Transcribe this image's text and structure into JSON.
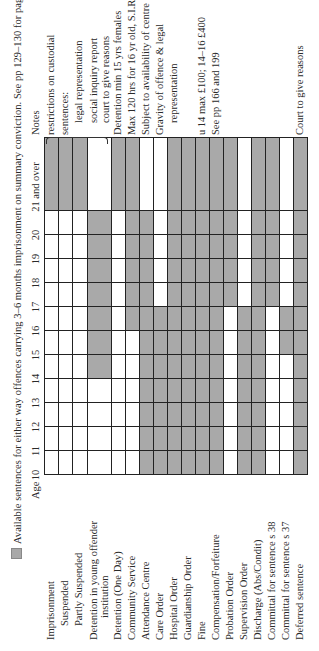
{
  "title": {
    "legend_label": "Available sentences for either way offences carrying 3–6 months imprisonment on summary conviction. See pp 129–130 for page references.",
    "legend_color": "#a9a9a9"
  },
  "header": {
    "age_word": "Age",
    "notes_word": "Notes",
    "ages": [
      "10",
      "11",
      "12",
      "13",
      "14",
      "15",
      "16",
      "17",
      "18",
      "19",
      "20",
      "21 and over"
    ]
  },
  "chart_data": {
    "type": "table",
    "title": "Available sentences for either way offences carrying 3–6 months imprisonment on summary conviction. See pp 129–130 for page references.",
    "columns": [
      "10",
      "11",
      "12",
      "13",
      "14",
      "15",
      "16",
      "17",
      "18",
      "19",
      "20",
      "21 and over"
    ],
    "legend": {
      "shaded": "Available sentence"
    },
    "rows": [
      {
        "label": "Imprisonment",
        "indent": false,
        "available": [
          0,
          0,
          0,
          0,
          0,
          0,
          0,
          0,
          0,
          0,
          0,
          1
        ]
      },
      {
        "label": "Suspended",
        "indent": true,
        "available": [
          0,
          0,
          0,
          0,
          0,
          0,
          0,
          0,
          0,
          0,
          0,
          1
        ]
      },
      {
        "label": "Partly Suspended",
        "indent": true,
        "available": [
          0,
          0,
          0,
          0,
          0,
          0,
          0,
          0,
          0,
          0,
          0,
          1
        ]
      },
      {
        "label": "Detention in young offender institution",
        "label_lines": [
          "Detention in young offender",
          "institution"
        ],
        "indent": false,
        "available": [
          0,
          0,
          0,
          0,
          1,
          1,
          1,
          1,
          1,
          1,
          1,
          0
        ]
      },
      {
        "label": "Detention (One Day)",
        "indent": false,
        "available": [
          0,
          0,
          0,
          0,
          0,
          0,
          0,
          0,
          0,
          0,
          0,
          1
        ]
      },
      {
        "label": "Community Service",
        "indent": false,
        "available": [
          0,
          0,
          0,
          0,
          0,
          0,
          1,
          1,
          1,
          1,
          1,
          1
        ]
      },
      {
        "label": "Attendance Centre",
        "indent": false,
        "available": [
          1,
          1,
          1,
          1,
          1,
          1,
          1,
          1,
          1,
          1,
          1,
          0
        ]
      },
      {
        "label": "Care Order",
        "indent": false,
        "available": [
          1,
          1,
          1,
          1,
          1,
          1,
          1,
          0,
          0,
          0,
          0,
          0
        ]
      },
      {
        "label": "Hospital Order",
        "indent": false,
        "available": [
          1,
          1,
          1,
          1,
          1,
          1,
          1,
          1,
          1,
          1,
          1,
          1
        ]
      },
      {
        "label": "Guardianship Order",
        "indent": false,
        "available": [
          1,
          1,
          1,
          1,
          1,
          1,
          1,
          1,
          1,
          1,
          1,
          1
        ]
      },
      {
        "label": "Fine",
        "indent": false,
        "available": [
          1,
          1,
          1,
          1,
          1,
          1,
          1,
          1,
          1,
          1,
          1,
          1
        ]
      },
      {
        "label": "Compensation/Forfeiture",
        "indent": false,
        "available": [
          1,
          1,
          1,
          1,
          1,
          1,
          1,
          1,
          1,
          1,
          1,
          1
        ]
      },
      {
        "label": "Probation Order",
        "indent": false,
        "available": [
          0,
          0,
          0,
          0,
          0,
          0,
          0,
          1,
          1,
          1,
          1,
          1
        ]
      },
      {
        "label": "Supervision Order",
        "indent": false,
        "available": [
          1,
          1,
          1,
          1,
          1,
          1,
          1,
          0,
          0,
          0,
          0,
          0
        ]
      },
      {
        "label": "Discharge (Abs/Condit)",
        "indent": false,
        "available": [
          1,
          1,
          1,
          1,
          1,
          1,
          1,
          1,
          1,
          1,
          1,
          1
        ]
      },
      {
        "label": "Committal for sentence s 38",
        "indent": false,
        "available": [
          0,
          0,
          0,
          0,
          0,
          0,
          0,
          1,
          1,
          1,
          1,
          1
        ]
      },
      {
        "label": "Committal for sentence s 37",
        "indent": false,
        "available": [
          0,
          0,
          0,
          0,
          0,
          1,
          1,
          0,
          0,
          0,
          0,
          0
        ]
      },
      {
        "label": "Deferred sentence",
        "indent": false,
        "available": [
          1,
          1,
          1,
          1,
          1,
          1,
          1,
          1,
          1,
          1,
          1,
          1
        ]
      }
    ]
  },
  "notes": [
    {
      "row": 0,
      "text": "restrictions on custodial"
    },
    {
      "row": 1,
      "text": "sentences:"
    },
    {
      "row": 2,
      "text": "legal representation",
      "indent": true
    },
    {
      "row": 3,
      "text": "social inquiry report",
      "indent": true
    },
    {
      "row": 3.5,
      "text": "court to give reasons",
      "indent": true
    },
    {
      "row": 4,
      "text": "Detention min 15 yrs females"
    },
    {
      "row": 5,
      "text": "Max 120 hrs for 16 yr old, S.I.R."
    },
    {
      "row": 6,
      "text": "Subject to availability of centre"
    },
    {
      "row": 7,
      "text": "Gravity of offence & legal"
    },
    {
      "row": 8,
      "text": "representation",
      "indent": true
    },
    {
      "row": 10,
      "text": "u 14 max £100; 14–16 £400"
    },
    {
      "row": 11,
      "text": "See pp 166 and 199"
    },
    {
      "row": 17,
      "text": "Court to give reasons"
    }
  ]
}
